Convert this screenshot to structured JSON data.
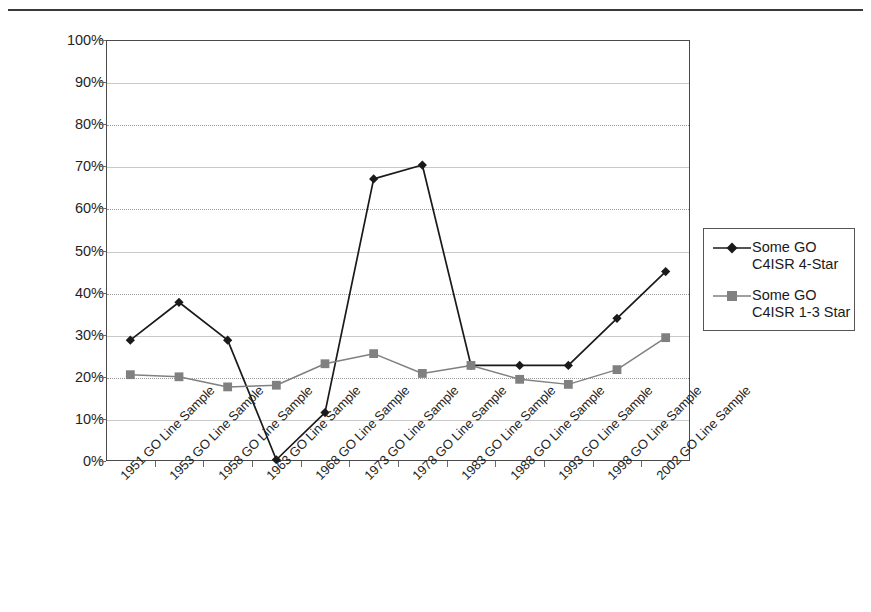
{
  "chart_data": {
    "type": "line",
    "title": "",
    "xlabel": "",
    "ylabel": "",
    "ylim": [
      0,
      100
    ],
    "ytick_labels": [
      "100%",
      "90%",
      "80%",
      "70%",
      "60%",
      "50%",
      "40%",
      "30%",
      "20%",
      "10%",
      "0%"
    ],
    "ytick_values": [
      100,
      90,
      80,
      70,
      60,
      50,
      40,
      30,
      20,
      10,
      0
    ],
    "grid": true,
    "legend_position": "right",
    "categories": [
      "1951 GO Line Sample",
      "1953 GO Line Sample",
      "1958 GO Line Sample",
      "1963 GO Line Sample",
      "1968 GO Line Sample",
      "1973 GO Line Sample",
      "1978 GO Line Sample",
      "1983 GO Line Sample",
      "1988 GO Line Sample",
      "1993 GO Line Sample",
      "1998 GO Line Sample",
      "2002 GO Line Sample"
    ],
    "series": [
      {
        "name": "Some GO C4ISR 4-Star",
        "name_line1": "Some GO",
        "name_line2": "C4ISR 4-Star",
        "color": "#1a1a1a",
        "marker": "diamond",
        "values": [
          28.7,
          37.7,
          28.7,
          0.3,
          11.5,
          67.0,
          70.3,
          22.7,
          22.7,
          22.7,
          33.9,
          45.0
        ]
      },
      {
        "name": "Some GO C4ISR 1-3 Star",
        "name_line1": "Some GO",
        "name_line2": "C4ISR 1-3 Star",
        "color": "#808080",
        "marker": "square",
        "values": [
          20.5,
          20.0,
          17.6,
          18.0,
          23.1,
          25.5,
          20.8,
          22.7,
          19.4,
          18.2,
          21.7,
          29.3
        ]
      }
    ]
  },
  "legend": {
    "entries": [
      {
        "line1": "Some GO",
        "line2": "C4ISR 4-Star"
      },
      {
        "line1": "Some GO",
        "line2": "C4ISR 1-3 Star"
      }
    ]
  }
}
